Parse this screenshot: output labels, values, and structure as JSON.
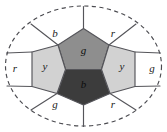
{
  "figure": {
    "type": "planar-graph-diagram",
    "boundary": {
      "shape": "ellipse",
      "style": "dashed",
      "cx": 83.5,
      "cy": 66,
      "rx": 78,
      "ry": 60,
      "color": "#4a4a4f"
    },
    "colors": {
      "outer_face_fill": "#ffffff",
      "light_gray": "#d2d2d2",
      "medium_gray": "#8e8e8e",
      "dark_gray": "#3c3c3c",
      "edge_stroke": "#55555a",
      "label_text": "#1a1a1a"
    },
    "inner_faces": [
      {
        "id": "inner-top-center",
        "label": "g",
        "fill_name": "medium_gray",
        "fill": "#8e8e8e",
        "label_x": 83.5,
        "label_y": 50,
        "points": "83.5,28.5 109,45 101.5,69.5 65.5,69.5 58,45"
      },
      {
        "id": "inner-bottom-center",
        "label": "b",
        "fill_name": "dark_gray",
        "fill": "#3c3c3c",
        "label_x": 83.5,
        "label_y": 84,
        "points": "65.5,69.5 101.5,69.5 110,93.5 83.5,105 57,93.5"
      },
      {
        "id": "inner-left",
        "label": "y",
        "fill_name": "light_gray",
        "fill": "#d2d2d2",
        "label_x": 45,
        "label_y": 66,
        "points": "58,45 65.5,69.5 57,93.5 32,86.5 32,52"
      },
      {
        "id": "inner-right",
        "label": "y",
        "fill_name": "light_gray",
        "fill": "#d2d2d2",
        "label_x": 122,
        "label_y": 66,
        "points": "109,45 135,52 135,86.5 110,93.5 101.5,69.5"
      }
    ],
    "outer_faces": [
      {
        "id": "outer-top-left",
        "label": "b",
        "fill_name": "outer_face_fill",
        "fill": "#ffffff",
        "label_x": 55,
        "label_y": 33
      },
      {
        "id": "outer-top-right",
        "label": "r",
        "fill_name": "outer_face_fill",
        "fill": "#ffffff",
        "label_x": 113,
        "label_y": 33
      },
      {
        "id": "outer-left",
        "label": "r",
        "fill_name": "outer_face_fill",
        "fill": "#ffffff",
        "label_x": 15,
        "label_y": 68
      },
      {
        "id": "outer-right",
        "label": "g",
        "fill_name": "outer_face_fill",
        "fill": "#ffffff",
        "label_x": 152,
        "label_y": 68
      },
      {
        "id": "outer-bottom-left",
        "label": "g",
        "fill_name": "outer_face_fill",
        "fill": "#ffffff",
        "label_x": 55,
        "label_y": 104
      },
      {
        "id": "outer-bottom-right",
        "label": "r",
        "fill_name": "outer_face_fill",
        "fill": "#ffffff",
        "label_x": 113,
        "label_y": 104
      }
    ],
    "radial_edges": [
      {
        "id": "edge-top-apex",
        "d": "M 83.5,28.5 L 83.5,6.5"
      },
      {
        "id": "edge-bottom-apex",
        "d": "M 83.5,105 L 83.5,126.5"
      },
      {
        "id": "edge-upper-left",
        "d": "M 58,45 L 31,24"
      },
      {
        "id": "edge-upper-right",
        "d": "M 109,45 L 136,24"
      },
      {
        "id": "edge-mid-left",
        "d": "M 32,52 L 6.5,53"
      },
      {
        "id": "edge-mid-right",
        "d": "M 135,52 L 160.5,53"
      },
      {
        "id": "edge-lower-left",
        "d": "M 32,86.5 L 7,86"
      },
      {
        "id": "edge-lower-right",
        "d": "M 135,86.5 L 160,86"
      },
      {
        "id": "edge-bottom-left",
        "d": "M 57,93.5 L 31,110"
      },
      {
        "id": "edge-bottom-right",
        "d": "M 110,93.5 L 136,110"
      }
    ]
  }
}
